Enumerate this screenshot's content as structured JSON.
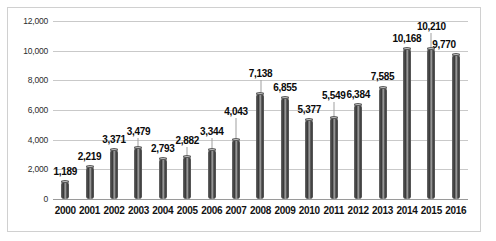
{
  "chart_data": {
    "type": "bar",
    "title": "",
    "xlabel": "",
    "ylabel": "",
    "ylim": [
      0,
      12000
    ],
    "ytick_step": 2000,
    "grid": true,
    "legend": "none",
    "categories": [
      "2000",
      "2001",
      "2002",
      "2003",
      "2004",
      "2005",
      "2006",
      "2007",
      "2008",
      "2009",
      "2010",
      "2011",
      "2012",
      "2013",
      "2014",
      "2015",
      "2016"
    ],
    "values": [
      1189,
      2219,
      3371,
      3479,
      2793,
      2882,
      3344,
      4043,
      7138,
      6855,
      5377,
      5549,
      6384,
      7585,
      10168,
      10210,
      9770
    ],
    "value_labels": [
      "1,189",
      "2,219",
      "3,371",
      "3,479",
      "2,793",
      "2,882",
      "3,344",
      "4,043",
      "7,138",
      "6,855",
      "5,377",
      "5,549",
      "6,384",
      "7,585",
      "10,168",
      "10,210",
      "9,770"
    ],
    "ytick_labels": [
      "0",
      "2,000",
      "4,000",
      "6,000",
      "8,000",
      "10,000",
      "12,000"
    ],
    "ytick_values": [
      0,
      2000,
      4000,
      6000,
      8000,
      10000,
      12000
    ],
    "colors": {
      "bar": "#4a4a4a",
      "bar_highlight": "#9b9b9b",
      "gridline": "#c9c9c9",
      "axis": "#9a9a9a",
      "label_text": "#0a0a0a",
      "plot_background": "#ffffff",
      "border": "#d0d0d0"
    }
  }
}
